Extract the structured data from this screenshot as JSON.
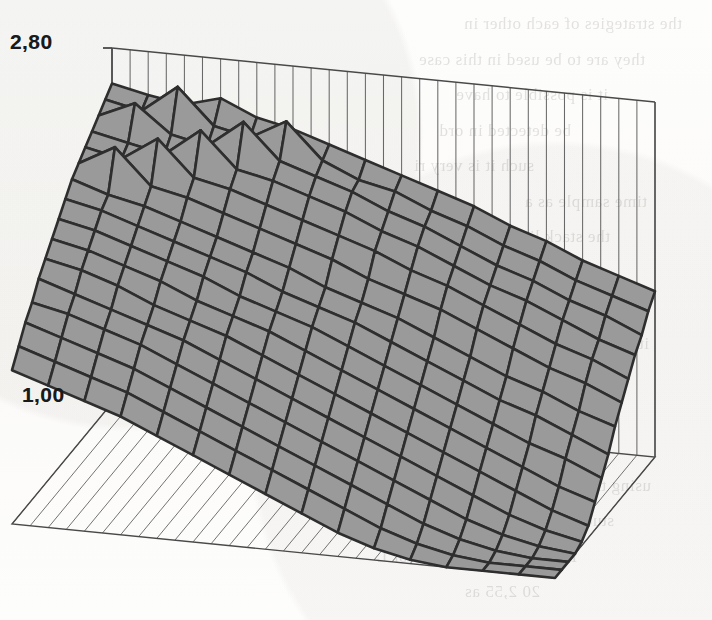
{
  "figure": {
    "kind": "3d-surface-mesh-plot",
    "media": "scanned-book-page",
    "background_note": "faint mirrored bleed-through text from reverse page"
  },
  "axes": {
    "z_axis": {
      "name": "vertical-value-axis",
      "top_tick_label": "2,80",
      "bottom_tick_label": "1,00",
      "decimal_separator": "comma",
      "range": [
        1.0,
        2.8
      ],
      "tick_count": 2
    },
    "back_wall": {
      "vertical_gridline_count": 30,
      "gridlines_visible": true
    },
    "floor": {
      "gridline_count": 30,
      "gridlines_visible": true
    }
  },
  "colors": {
    "surface_fill": "#9a9a9a",
    "surface_edge": "#2e2e2e",
    "axis_line": "#4a4a4a",
    "gridline": "#5a5a5a",
    "label_text": "#1a1a1a",
    "paper": "#fdfdfc",
    "ghost_text": "#5d5a55"
  },
  "ghost_text_lines": [
    "the strategies of each other in",
    "they are to be used in this case",
    "it is possible to have",
    "be detected in ord",
    "such it is very ri",
    "time sample as a",
    "the stack list of row",
    "the strict strateg",
    "cooperate on the firs",
    "it is concluded that the",
    "for one with the follow",
    "an CSS in th",
    "of other game in our tra",
    "using the wire code key and co",
    "stuctures. To copy of four points and",
    "Fish(D,S) and 270,25 for L",
    "20 2,55 as"
  ],
  "chart_data": {
    "type": "surface",
    "title": "",
    "xlabel": "",
    "ylabel": "",
    "zlabel": "",
    "zlim": [
      1.0,
      2.8
    ],
    "z_tick_labels": [
      "1,00",
      "2,80"
    ],
    "grid": true,
    "legend": "none",
    "mesh": {
      "rows": 16,
      "cols": 16
    },
    "z_matrix": [
      [
        2.62,
        2.58,
        2.55,
        2.6,
        2.52,
        2.48,
        2.42,
        2.36,
        2.3,
        2.24,
        2.18,
        2.1,
        2.04,
        1.96,
        1.9,
        1.84
      ],
      [
        2.58,
        2.54,
        2.68,
        2.5,
        2.46,
        2.56,
        2.38,
        2.3,
        2.26,
        2.18,
        2.12,
        2.04,
        1.98,
        1.9,
        1.84,
        1.78
      ],
      [
        2.54,
        2.62,
        2.48,
        2.44,
        2.58,
        2.4,
        2.34,
        2.28,
        2.2,
        2.14,
        2.06,
        1.98,
        1.92,
        1.84,
        1.78,
        1.7
      ],
      [
        2.5,
        2.46,
        2.42,
        2.56,
        2.38,
        2.34,
        2.28,
        2.22,
        2.14,
        2.08,
        2.0,
        1.92,
        1.86,
        1.78,
        1.7,
        1.64
      ],
      [
        2.46,
        2.42,
        2.54,
        2.36,
        2.32,
        2.26,
        2.2,
        2.14,
        2.08,
        2.0,
        1.94,
        1.86,
        1.78,
        1.7,
        1.64,
        1.56
      ],
      [
        2.42,
        2.52,
        2.34,
        2.3,
        2.24,
        2.18,
        2.12,
        2.06,
        1.98,
        1.92,
        1.86,
        1.78,
        1.7,
        1.62,
        1.56,
        1.48
      ],
      [
        2.38,
        2.32,
        2.28,
        2.22,
        2.16,
        2.1,
        2.04,
        1.96,
        1.9,
        1.84,
        1.76,
        1.68,
        1.6,
        1.54,
        1.46,
        1.4
      ],
      [
        2.32,
        2.28,
        2.22,
        2.16,
        2.1,
        2.04,
        1.96,
        1.9,
        1.84,
        1.76,
        1.68,
        1.6,
        1.52,
        1.46,
        1.38,
        1.3
      ],
      [
        2.26,
        2.22,
        2.16,
        2.1,
        2.04,
        1.96,
        1.9,
        1.84,
        1.76,
        1.68,
        1.6,
        1.52,
        1.44,
        1.36,
        1.3,
        1.22
      ],
      [
        2.2,
        2.16,
        2.1,
        2.04,
        1.96,
        1.9,
        1.84,
        1.76,
        1.68,
        1.6,
        1.52,
        1.44,
        1.36,
        1.28,
        1.2,
        1.14
      ],
      [
        2.14,
        2.1,
        2.04,
        1.96,
        1.9,
        1.84,
        1.76,
        1.68,
        1.6,
        1.52,
        1.44,
        1.36,
        1.28,
        1.2,
        1.12,
        1.06
      ],
      [
        2.08,
        2.02,
        1.96,
        1.9,
        1.84,
        1.76,
        1.68,
        1.6,
        1.52,
        1.44,
        1.36,
        1.28,
        1.2,
        1.12,
        1.06,
        1.02
      ],
      [
        2.0,
        1.96,
        1.9,
        1.84,
        1.76,
        1.68,
        1.6,
        1.52,
        1.44,
        1.36,
        1.28,
        1.2,
        1.12,
        1.06,
        1.02,
        1.0
      ],
      [
        1.94,
        1.88,
        1.82,
        1.76,
        1.68,
        1.6,
        1.52,
        1.44,
        1.36,
        1.28,
        1.2,
        1.12,
        1.06,
        1.02,
        1.0,
        1.0
      ],
      [
        1.86,
        1.8,
        1.74,
        1.68,
        1.6,
        1.52,
        1.44,
        1.36,
        1.28,
        1.2,
        1.12,
        1.06,
        1.02,
        1.0,
        1.0,
        1.0
      ],
      [
        1.78,
        1.72,
        1.66,
        1.6,
        1.52,
        1.44,
        1.36,
        1.28,
        1.2,
        1.12,
        1.06,
        1.02,
        1.0,
        1.0,
        1.0,
        1.0
      ]
    ]
  }
}
